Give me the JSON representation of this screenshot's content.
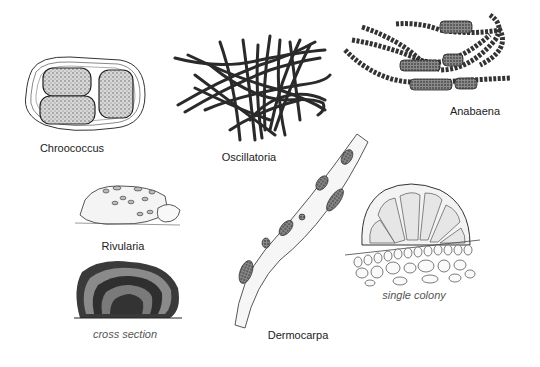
{
  "figure": {
    "colors": {
      "ink": "#222222",
      "stipple": "#6a6a6a",
      "paper": "#ffffff"
    },
    "specimens": [
      {
        "id": "chroococcus",
        "label": "Chroococcus",
        "label_x": 72,
        "label_y": 142,
        "italic": false
      },
      {
        "id": "oscillatoria",
        "label": "Oscillatoria",
        "label_x": 249,
        "label_y": 151,
        "italic": false
      },
      {
        "id": "anabaena",
        "label": "Anabaena",
        "label_x": 475,
        "label_y": 105,
        "italic": false
      },
      {
        "id": "rivularia",
        "label": "Rivularia",
        "label_x": 123,
        "label_y": 240,
        "italic": false
      },
      {
        "id": "rivularia-cross-section",
        "label": "cross section",
        "label_x": 125,
        "label_y": 328,
        "italic": true
      },
      {
        "id": "dermocarpa",
        "label": "Dermocarpa",
        "label_x": 298,
        "label_y": 329,
        "italic": false
      },
      {
        "id": "dermocarpa-single-colony",
        "label": "single colony",
        "label_x": 414,
        "label_y": 289,
        "italic": true
      }
    ]
  }
}
